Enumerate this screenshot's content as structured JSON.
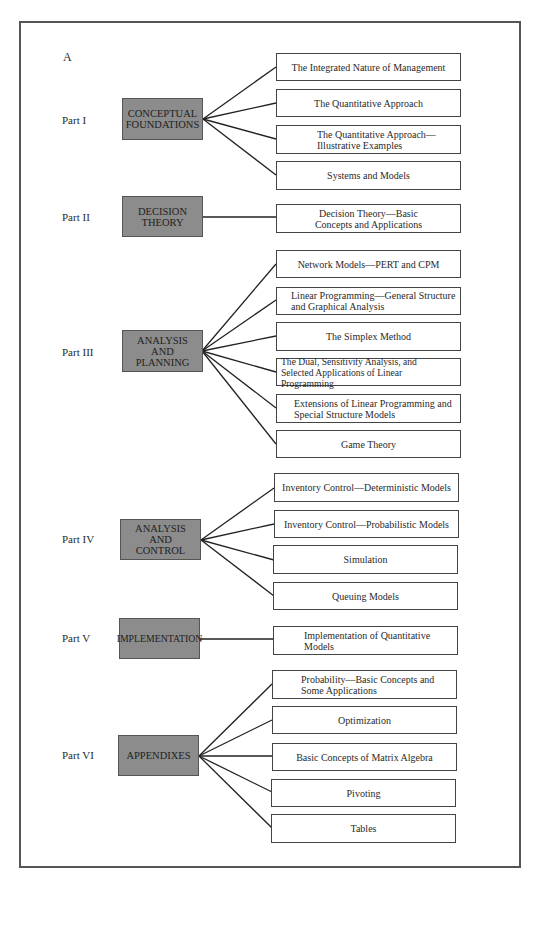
{
  "figure": {
    "letter": "A",
    "parts": [
      {
        "label": "Part I",
        "title": "CONCEPTUAL\nFOUNDATIONS",
        "topics": [
          "The Integrated Nature of Management",
          "The Quantitative Approach",
          "The Quantitative Approach—\nIllustrative Examples",
          "Systems and Models"
        ]
      },
      {
        "label": "Part II",
        "title": "DECISION\nTHEORY",
        "topics": [
          "Decision Theory—Basic\nConcepts and Applications"
        ]
      },
      {
        "label": "Part III",
        "title": "ANALYSIS\nAND\nPLANNING",
        "topics": [
          "Network Models—PERT and CPM",
          "Linear Programming—General Structure\nand Graphical Analysis",
          "The Simplex Method",
          "The Dual, Sensitivity Analysis, and\nSelected Applications of Linear Programming",
          "Extensions of Linear Programming and\nSpecial Structure Models",
          "Game Theory"
        ]
      },
      {
        "label": "Part IV",
        "title": "ANALYSIS\nAND\nCONTROL",
        "topics": [
          "Inventory Control—Deterministic Models",
          "Inventory Control—Probabilistic Models",
          "Simulation",
          "Queuing Models"
        ]
      },
      {
        "label": "Part V",
        "title": "IMPLEMENTATION",
        "topics": [
          "Implementation of Quantitative\nModels"
        ]
      },
      {
        "label": "Part VI",
        "title": "APPENDIXES",
        "topics": [
          "Probability—Basic Concepts and\nSome Applications",
          "Optimization",
          "Basic Concepts of Matrix Algebra",
          "Pivoting",
          "Tables"
        ]
      }
    ]
  },
  "colors": {
    "part_box_fill": "#8c8c8c",
    "border": "#444444",
    "background": "#ffffff"
  }
}
